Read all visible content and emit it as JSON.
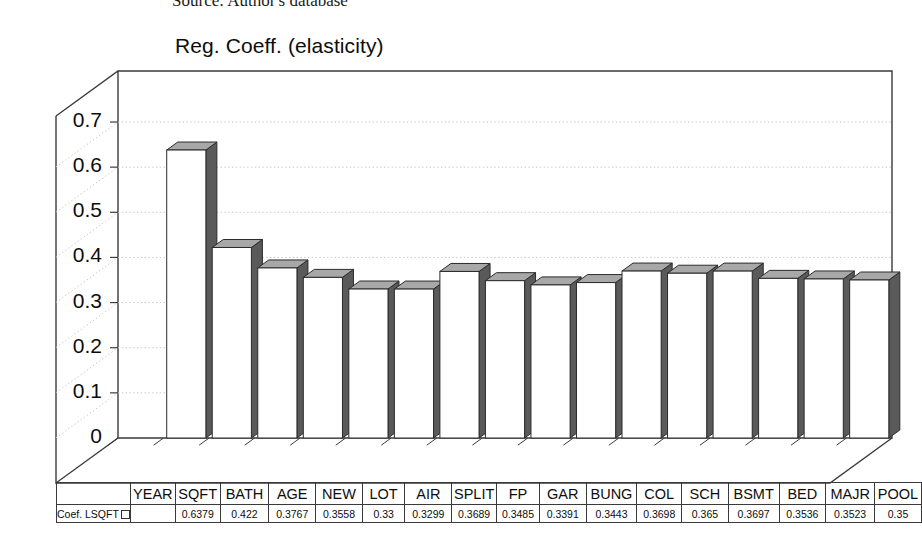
{
  "source_note": "Source: Author's database",
  "chart_data": {
    "type": "bar",
    "title": "Reg. Coeff. (elasticity)",
    "xlabel": "",
    "ylabel": "",
    "ylim": [
      0,
      0.7
    ],
    "yticks": [
      "0",
      "0.1",
      "0.2",
      "0.3",
      "0.4",
      "0.5",
      "0.6",
      "0.7"
    ],
    "ytick_values": [
      0,
      0.1,
      0.2,
      0.3,
      0.4,
      0.5,
      0.6,
      0.7
    ],
    "grid": true,
    "three_d": true,
    "legend": [
      "Coef. LSQFT"
    ],
    "legend_position": "bottom-left-table",
    "categories": [
      "YEAR",
      "SQFT",
      "BATH",
      "AGE",
      "NEW",
      "LOT",
      "AIR",
      "SPLIT",
      "FP",
      "GAR",
      "BUNG",
      "COL",
      "SCH",
      "BSMT",
      "BED",
      "MAJR",
      "POOL"
    ],
    "values": [
      null,
      0.6379,
      0.422,
      0.3767,
      0.3558,
      0.33,
      0.3299,
      0.3689,
      0.3485,
      0.3391,
      0.3443,
      0.3698,
      0.365,
      0.3697,
      0.3536,
      0.3523,
      0.35
    ],
    "value_labels": [
      "",
      "0.6379",
      "0.422",
      "0.3767",
      "0.3558",
      "0.33",
      "0.3299",
      "0.3689",
      "0.3485",
      "0.3391",
      "0.3443",
      "0.3698",
      "0.365",
      "0.3697",
      "0.3536",
      "0.3523",
      "0.35"
    ],
    "series": [
      {
        "name": "Coef. LSQFT",
        "values": [
          null,
          0.6379,
          0.422,
          0.3767,
          0.3558,
          0.33,
          0.3299,
          0.3689,
          0.3485,
          0.3391,
          0.3443,
          0.3698,
          0.365,
          0.3697,
          0.3536,
          0.3523,
          0.35
        ]
      }
    ]
  },
  "colors": {
    "bar_front": "#ffffff",
    "bar_top": "#a8a8a8",
    "bar_side": "#5a5a5a",
    "axis": "#3a3a3a",
    "grid": "#c8c8c8",
    "text": "#0d0d0d"
  }
}
